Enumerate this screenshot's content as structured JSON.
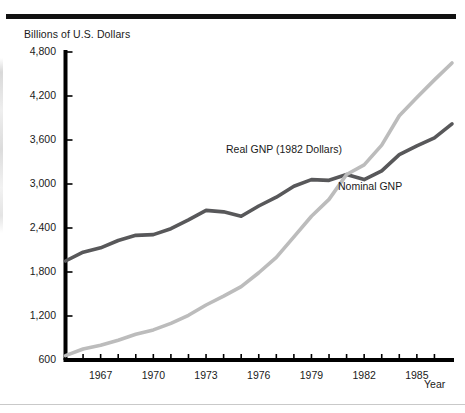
{
  "figure": {
    "y_axis_title": "Billions of U.S. Dollars",
    "x_axis_title": "Year"
  },
  "colors": {
    "real_gnp": "#58585a",
    "nominal_gnp": "#bcbcbc",
    "axis": "#000000",
    "rule_top": "#111111",
    "rule_bottom": "#c9c9c9"
  },
  "annotations": {
    "real_label": "Real GNP (1982 Dollars)",
    "nominal_label": "Nominal GNP"
  },
  "chart_data": {
    "type": "line",
    "title": "",
    "xlabel": "Year",
    "ylabel": "Billions of U.S. Dollars",
    "xlim": [
      1965,
      1987
    ],
    "ylim": [
      600,
      4800
    ],
    "grid": false,
    "legend": "inline-annotations",
    "y_ticks": [
      600,
      1200,
      1800,
      2400,
      3000,
      3600,
      4200,
      4800
    ],
    "y_tick_labels": [
      "600",
      "1,200",
      "1,800",
      "2,400",
      "3,000",
      "3,600",
      "4,200",
      "4,800"
    ],
    "x_ticks": [
      1966,
      1967,
      1968,
      1969,
      1970,
      1971,
      1972,
      1973,
      1974,
      1975,
      1976,
      1977,
      1978,
      1979,
      1980,
      1981,
      1982,
      1983,
      1984,
      1985,
      1986
    ],
    "x_tick_labels_shown": [
      "1967",
      "1970",
      "1973",
      "1976",
      "1979",
      "1982",
      "1985"
    ],
    "x": [
      1965,
      1966,
      1967,
      1968,
      1969,
      1970,
      1971,
      1972,
      1973,
      1974,
      1975,
      1976,
      1977,
      1978,
      1979,
      1980,
      1981,
      1982,
      1983,
      1984,
      1985,
      1986,
      1987
    ],
    "series": [
      {
        "name": "Real GNP (1982 Dollars)",
        "color": "#58585a",
        "values": [
          1950,
          2070,
          2130,
          2230,
          2300,
          2310,
          2390,
          2510,
          2640,
          2620,
          2560,
          2700,
          2820,
          2970,
          3060,
          3050,
          3130,
          3060,
          3180,
          3400,
          3520,
          3630,
          3820
        ]
      },
      {
        "name": "Nominal GNP",
        "color": "#bcbcbc",
        "values": [
          660,
          750,
          800,
          870,
          950,
          1010,
          1100,
          1210,
          1350,
          1470,
          1600,
          1790,
          2000,
          2280,
          2560,
          2790,
          3130,
          3260,
          3530,
          3930,
          4180,
          4420,
          4650
        ]
      }
    ]
  }
}
